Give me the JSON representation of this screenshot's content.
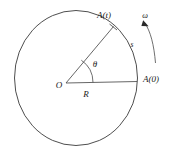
{
  "figure": {
    "background_color": "#ffffff",
    "line_color": "#3a3a3a",
    "label_color": "#1a1a1a",
    "labels": {
      "point_at_time_t": "A(t)",
      "point_at_time_zero": "A(0)",
      "angular_velocity": "ω",
      "arc_length": "s",
      "angle": "θ",
      "center": "O",
      "radius": "R"
    },
    "geometry": {
      "center_x": 66,
      "center_y": 81,
      "radius_x": 71,
      "radius_y": 67,
      "angle_degrees": 55,
      "angle_arc_radius": 27,
      "rotation_direction": "counterclockwise"
    }
  }
}
